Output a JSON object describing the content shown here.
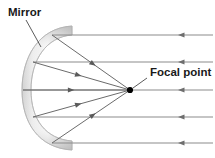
{
  "diagram": {
    "title_alt": "Concave mirror focusing parallel light rays",
    "background_color": "#ffffff",
    "labels": {
      "mirror": "Mirror",
      "focal_point": "Focal point"
    },
    "colors": {
      "ray": "#8c8c8c",
      "reflected_ray": "#6b6b6b",
      "arrow": "#6e6e6e",
      "mirror_light": "#f2f2f2",
      "mirror_mid": "#d9d9d9",
      "mirror_dark": "#b5b5b5",
      "mirror_outline": "#b0b0b0",
      "focal_dot": "#000000",
      "label_text": "#1a1a1a",
      "leader": "#4a4a4a"
    },
    "focal_point": {
      "x": 130,
      "y": 90,
      "radius": 3.1
    },
    "mirror": {
      "shape": "concave-arc",
      "thickness": 9,
      "top_end": {
        "x": 72,
        "y": 26
      },
      "bottom_end": {
        "x": 72,
        "y": 150
      },
      "vertex": {
        "x": 22,
        "y": 90
      }
    },
    "mirror_label_leader": {
      "x1": 26,
      "y1": 20,
      "x2": 41,
      "y2": 47
    },
    "mirror_label_pos": {
      "x": 8,
      "y": 16
    },
    "focal_label_pos": {
      "x": 150,
      "y": 76
    },
    "focal_label_leader": {
      "x1": 147,
      "y1": 78,
      "x2": 133,
      "y2": 88
    },
    "incoming_rays": [
      {
        "id": "ray-1",
        "y": 35,
        "x_start": 213,
        "x_end": 52,
        "arrow_x": 178
      },
      {
        "id": "ray-2",
        "y": 62,
        "x_start": 213,
        "x_end": 33,
        "arrow_x": 178
      },
      {
        "id": "ray-3",
        "y": 90,
        "x_start": 213,
        "x_end": 23,
        "arrow_x": 178
      },
      {
        "id": "ray-4",
        "y": 117,
        "x_start": 213,
        "x_end": 33,
        "arrow_x": 178
      },
      {
        "id": "ray-5",
        "y": 143,
        "x_start": 213,
        "x_end": 52,
        "arrow_x": 178
      }
    ],
    "reflected_rays": [
      {
        "id": "refl-1",
        "x1": 52,
        "y1": 35,
        "x2": 130,
        "y2": 90,
        "arrow_t": 0.56
      },
      {
        "id": "refl-2",
        "x1": 33,
        "y1": 62,
        "x2": 130,
        "y2": 90,
        "arrow_t": 0.5
      },
      {
        "id": "refl-3",
        "x1": 23,
        "y1": 90,
        "x2": 130,
        "y2": 90,
        "arrow_t": 0.48
      },
      {
        "id": "refl-4",
        "x1": 33,
        "y1": 117,
        "x2": 130,
        "y2": 90,
        "arrow_t": 0.5
      },
      {
        "id": "refl-5",
        "x1": 52,
        "y1": 143,
        "x2": 130,
        "y2": 90,
        "arrow_t": 0.56
      }
    ]
  }
}
